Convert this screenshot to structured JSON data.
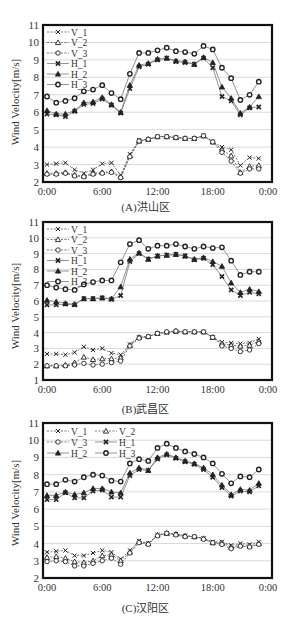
{
  "figure": {
    "x_tick_labels": [
      "0:00",
      "6:00",
      "12:00",
      "18:00",
      "0:00"
    ],
    "ylabel": "Wind Velocity[m/s]",
    "series_names": [
      "V_1",
      "V_2",
      "V_3",
      "H_1",
      "H_2",
      "H_3"
    ],
    "colors": {
      "frame": "#111111",
      "grid": "#cfcfcf",
      "V_lines": "#555555",
      "H_lines": "#777777",
      "markers": "#222222"
    }
  },
  "chart_data": [
    {
      "id": "A",
      "type": "line",
      "title": "(A)洪山区",
      "xlabel": "",
      "ylabel": "Wind Velocity[m/s]",
      "ylim": [
        2,
        11
      ],
      "yticks": [
        2,
        3,
        4,
        5,
        6,
        7,
        8,
        9,
        10,
        11
      ],
      "x_hours": [
        0,
        1,
        2,
        3,
        4,
        5,
        6,
        7,
        8,
        9,
        10,
        11,
        12,
        13,
        14,
        15,
        16,
        17,
        18,
        19,
        20,
        21,
        22,
        23
      ],
      "x_ticks": [
        "0:00",
        "6:00",
        "12:00",
        "18:00",
        "0:00"
      ],
      "legend_position": "upper-left, single column",
      "grid": true,
      "series": [
        {
          "name": "V_1",
          "marker": "x",
          "style": "dashed",
          "values": [
            3.0,
            3.05,
            3.1,
            2.7,
            2.5,
            2.7,
            3.05,
            3.1,
            2.4,
            3.6,
            4.4,
            4.45,
            4.6,
            4.6,
            4.55,
            4.5,
            4.5,
            4.65,
            4.3,
            4.0,
            3.85,
            2.95,
            3.4,
            3.35
          ]
        },
        {
          "name": "V_2",
          "marker": "triangle",
          "style": "dashed",
          "values": [
            2.5,
            2.5,
            2.55,
            2.4,
            2.35,
            2.5,
            2.55,
            2.6,
            2.3,
            3.5,
            4.35,
            4.45,
            4.6,
            4.6,
            4.55,
            4.5,
            4.5,
            4.65,
            4.3,
            3.85,
            3.5,
            2.55,
            2.9,
            2.95
          ]
        },
        {
          "name": "V_3",
          "marker": "circle",
          "style": "dashed",
          "values": [
            2.45,
            2.45,
            2.5,
            2.35,
            2.3,
            2.45,
            2.5,
            2.55,
            2.25,
            3.45,
            4.35,
            4.45,
            4.6,
            4.6,
            4.55,
            4.5,
            4.5,
            4.65,
            4.3,
            3.7,
            3.2,
            2.5,
            2.75,
            2.75
          ]
        },
        {
          "name": "H_1",
          "marker": "x",
          "style": "solid",
          "values": [
            5.9,
            5.85,
            5.75,
            6.05,
            6.45,
            6.5,
            6.75,
            6.4,
            5.95,
            7.35,
            8.6,
            8.75,
            9.0,
            9.1,
            8.9,
            8.85,
            8.75,
            9.1,
            8.55,
            6.9,
            6.65,
            5.85,
            6.25,
            6.3
          ]
        },
        {
          "name": "H_2",
          "marker": "triangle",
          "style": "solid",
          "values": [
            6.1,
            5.9,
            5.9,
            6.1,
            6.55,
            6.6,
            6.85,
            6.45,
            6.0,
            7.55,
            8.7,
            8.8,
            9.05,
            9.1,
            8.95,
            8.9,
            8.75,
            9.15,
            8.85,
            7.45,
            6.8,
            5.95,
            6.3,
            6.9
          ]
        },
        {
          "name": "H_3",
          "marker": "circle",
          "style": "solid",
          "values": [
            6.9,
            6.55,
            6.65,
            6.8,
            7.2,
            7.3,
            7.55,
            7.1,
            6.75,
            8.2,
            9.4,
            9.4,
            9.55,
            9.7,
            9.5,
            9.45,
            9.35,
            9.8,
            9.6,
            8.55,
            7.95,
            6.7,
            7.0,
            7.75
          ]
        }
      ]
    },
    {
      "id": "B",
      "type": "line",
      "title": "(B)武昌区",
      "xlabel": "",
      "ylabel": "Wind Velocity[m/s]",
      "ylim": [
        1,
        11
      ],
      "yticks": [
        1,
        2,
        3,
        4,
        5,
        6,
        7,
        8,
        9,
        10,
        11
      ],
      "x_hours": [
        0,
        1,
        2,
        3,
        4,
        5,
        6,
        7,
        8,
        9,
        10,
        11,
        12,
        13,
        14,
        15,
        16,
        17,
        18,
        19,
        20,
        21,
        22,
        23
      ],
      "x_ticks": [
        "0:00",
        "6:00",
        "12:00",
        "18:00",
        "0:00"
      ],
      "legend_position": "upper-left, single column",
      "grid": true,
      "series": [
        {
          "name": "V_1",
          "marker": "x",
          "style": "dashed",
          "values": [
            2.65,
            2.65,
            2.6,
            2.75,
            3.1,
            2.9,
            3.0,
            2.7,
            2.6,
            3.25,
            3.7,
            3.75,
            3.95,
            4.0,
            4.05,
            4.05,
            4.05,
            4.05,
            3.7,
            3.4,
            3.35,
            3.3,
            3.35,
            3.6
          ]
        },
        {
          "name": "V_2",
          "marker": "triangle",
          "style": "dashed",
          "values": [
            1.9,
            1.9,
            1.95,
            2.1,
            2.45,
            2.3,
            2.35,
            2.35,
            2.4,
            3.2,
            3.7,
            3.75,
            3.95,
            4.05,
            4.1,
            4.05,
            4.05,
            4.05,
            3.7,
            3.3,
            3.2,
            3.15,
            3.2,
            3.45
          ]
        },
        {
          "name": "V_3",
          "marker": "circle",
          "style": "dashed",
          "values": [
            1.9,
            1.9,
            1.9,
            1.95,
            2.05,
            1.95,
            2.0,
            2.1,
            2.2,
            3.15,
            3.65,
            3.75,
            3.95,
            4.05,
            4.1,
            4.05,
            4.05,
            4.05,
            3.7,
            3.15,
            3.0,
            2.8,
            2.9,
            3.3
          ]
        },
        {
          "name": "H_1",
          "marker": "x",
          "style": "solid",
          "values": [
            5.75,
            5.75,
            5.8,
            5.75,
            6.15,
            6.15,
            6.2,
            6.1,
            6.35,
            8.5,
            9.0,
            8.65,
            8.85,
            8.9,
            8.95,
            8.85,
            8.6,
            8.7,
            8.3,
            7.55,
            6.7,
            6.35,
            6.55,
            6.45
          ]
        },
        {
          "name": "H_2",
          "marker": "triangle",
          "style": "solid",
          "values": [
            6.05,
            5.95,
            5.85,
            5.8,
            6.15,
            6.15,
            6.2,
            6.15,
            6.9,
            8.65,
            9.05,
            8.65,
            8.85,
            8.9,
            8.95,
            8.85,
            8.65,
            8.75,
            8.5,
            8.2,
            7.15,
            6.55,
            6.75,
            6.6
          ]
        },
        {
          "name": "H_3",
          "marker": "circle",
          "style": "solid",
          "values": [
            7.0,
            6.85,
            6.75,
            6.7,
            7.05,
            7.2,
            7.3,
            7.3,
            8.45,
            9.6,
            9.85,
            9.3,
            9.5,
            9.5,
            9.6,
            9.45,
            9.3,
            9.45,
            9.35,
            9.4,
            8.55,
            7.65,
            7.85,
            7.85
          ]
        }
      ]
    },
    {
      "id": "C",
      "type": "line",
      "title": "(C)汉阳区",
      "xlabel": "",
      "ylabel": "Wind Velocity[m/s]",
      "ylim": [
        2,
        11
      ],
      "yticks": [
        2,
        3,
        4,
        5,
        6,
        7,
        8,
        9,
        10,
        11
      ],
      "x_hours": [
        0,
        1,
        2,
        3,
        4,
        5,
        6,
        7,
        8,
        9,
        10,
        11,
        12,
        13,
        14,
        15,
        16,
        17,
        18,
        19,
        20,
        21,
        22,
        23
      ],
      "x_ticks": [
        "0:00",
        "6:00",
        "12:00",
        "18:00",
        "0:00"
      ],
      "legend_position": "upper-left, two columns",
      "grid": true,
      "series": [
        {
          "name": "V_1",
          "marker": "x",
          "style": "dashed",
          "values": [
            3.5,
            3.55,
            3.6,
            3.3,
            3.3,
            3.45,
            3.6,
            3.5,
            3.1,
            3.6,
            4.15,
            4.0,
            4.5,
            4.6,
            4.55,
            4.45,
            4.4,
            4.3,
            4.1,
            4.1,
            3.9,
            4.0,
            3.95,
            4.1
          ]
        },
        {
          "name": "V_2",
          "marker": "triangle",
          "style": "dashed",
          "values": [
            3.2,
            3.25,
            3.15,
            2.95,
            2.9,
            3.0,
            3.3,
            3.35,
            3.0,
            3.5,
            4.1,
            4.0,
            4.5,
            4.6,
            4.55,
            4.45,
            4.4,
            4.3,
            4.05,
            4.05,
            3.8,
            3.9,
            3.85,
            4.0
          ]
        },
        {
          "name": "V_3",
          "marker": "circle",
          "style": "dashed",
          "values": [
            2.95,
            3.0,
            2.95,
            2.7,
            2.7,
            2.85,
            3.0,
            3.15,
            2.8,
            3.45,
            4.05,
            3.95,
            4.45,
            4.6,
            4.5,
            4.4,
            4.4,
            4.25,
            4.05,
            3.95,
            3.7,
            3.85,
            3.8,
            3.95
          ]
        },
        {
          "name": "H_1",
          "marker": "x",
          "style": "solid",
          "values": [
            6.55,
            6.55,
            6.95,
            6.65,
            6.65,
            7.05,
            7.1,
            6.7,
            6.7,
            7.95,
            8.3,
            8.25,
            8.9,
            9.15,
            8.95,
            8.75,
            8.6,
            8.3,
            7.85,
            7.25,
            6.75,
            7.05,
            7.0,
            7.35
          ]
        },
        {
          "name": "H_2",
          "marker": "triangle",
          "style": "solid",
          "values": [
            6.8,
            6.8,
            7.0,
            6.85,
            6.95,
            7.2,
            7.2,
            7.0,
            6.95,
            8.1,
            8.4,
            8.25,
            9.0,
            9.2,
            9.0,
            8.8,
            8.65,
            8.4,
            8.0,
            7.4,
            6.85,
            7.15,
            7.1,
            7.5
          ]
        },
        {
          "name": "H_3",
          "marker": "circle",
          "style": "solid",
          "values": [
            7.45,
            7.45,
            7.7,
            7.6,
            7.85,
            8.0,
            7.95,
            7.65,
            7.6,
            8.65,
            8.9,
            8.8,
            9.55,
            9.8,
            9.55,
            9.35,
            9.2,
            9.0,
            8.65,
            8.05,
            7.5,
            7.9,
            7.85,
            8.3
          ]
        }
      ]
    }
  ]
}
